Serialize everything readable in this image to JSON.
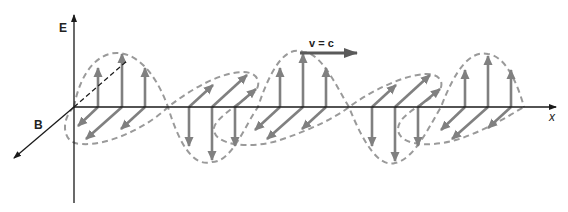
{
  "diagram": {
    "labels": {
      "e_axis": "E",
      "b_axis": "B",
      "x_axis": "x",
      "velocity": "v = c"
    },
    "colors": {
      "axis": "#1a1a1a",
      "field_arrow": "#808080",
      "envelope_dashed": "#9a9a9a",
      "velocity_arrow": "#5a5a5a",
      "background": "#ffffff"
    },
    "geometry": {
      "origin": [
        74,
        107
      ],
      "wavelength_px": 183,
      "e_amplitude_px": 55,
      "e_peaks_x": [
        122,
        212,
        303,
        395,
        488
      ],
      "e_peak_directions": [
        "up",
        "down",
        "up",
        "down",
        "up"
      ],
      "b_direction": "into-page / diagonal (down-left and up-right alternately)"
    }
  }
}
